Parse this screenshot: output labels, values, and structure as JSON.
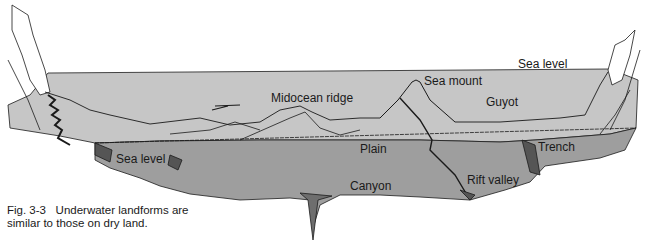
{
  "figure": {
    "caption_line1": "Fig. 3-3   Underwater landforms are",
    "caption_line2": "similar to those on dry land.",
    "colors": {
      "sea_surface": "#c6c6c6",
      "sea_floor_face": "#9e9e9e",
      "cliff": "#ffffff",
      "outline": "#1a1a1a",
      "background": "#ffffff"
    }
  },
  "labels": {
    "sea_level_top": "Sea level",
    "sea_mount": "Sea mount",
    "midocean_ridge": "Midocean ridge",
    "guyot": "Guyot",
    "plain": "Plain",
    "sea_level_bottom": "Sea level",
    "trench": "Trench",
    "canyon": "Canyon",
    "rift_valley": "Rift valley"
  }
}
